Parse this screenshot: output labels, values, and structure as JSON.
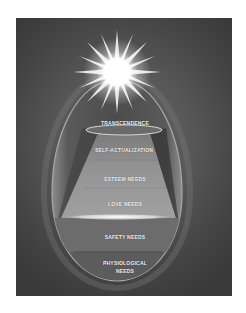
{
  "diagram": {
    "title": "",
    "type": "hierarchy-of-needs-egg",
    "symbol": "radiant-star",
    "levels": [
      {
        "label": "TRANSCENDENCE"
      },
      {
        "label": "SELF-ACTUALIZATION"
      },
      {
        "label": "ESTEEM NEEDS"
      },
      {
        "label": "LOVE NEEDS"
      },
      {
        "label": "SAFETY NEEDS"
      },
      {
        "label": "PHYSIOLOGICAL NEEDS",
        "line1": "PHYSIOLOGICAL",
        "line2": "NEEDS"
      }
    ],
    "colors": {
      "background_dark": "#3a3a3a",
      "background_mid": "#575757",
      "egg_outline": "#8a8a8a",
      "trapezoid": "#8e8e8e",
      "safety_band": "#6e6e6e",
      "physiological_band": "#5e5e5e",
      "label_text": "#f4f4f4"
    }
  }
}
